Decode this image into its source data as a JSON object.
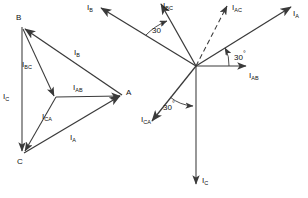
{
  "figure": {
    "stroke_color": "#3a3a3a",
    "dash_color": "#3a3a3a",
    "text_color": "#111111",
    "background": "#ffffff",
    "width": 308,
    "height": 198
  },
  "left_diagram": {
    "name": "delta-phasor-triangle",
    "vertex_labels": [
      {
        "id": "A",
        "text": "A",
        "x": 126,
        "y": 89
      },
      {
        "id": "B",
        "text": "B",
        "x": 16,
        "y": 14
      },
      {
        "id": "C",
        "text": "C",
        "x": 17,
        "y": 158
      }
    ],
    "phasor_labels": [
      {
        "id": "IB",
        "base": "I",
        "sub": "B",
        "x": 74,
        "y": 49
      },
      {
        "id": "IBC",
        "base": "I",
        "sub": "BC",
        "x": 22,
        "y": 61
      },
      {
        "id": "IC",
        "base": "I",
        "sub": "C",
        "x": 3,
        "y": 93
      },
      {
        "id": "IAB",
        "base": "I",
        "sub": "AB",
        "x": 73,
        "y": 84
      },
      {
        "id": "ICA",
        "base": "I",
        "sub": "CA",
        "x": 42,
        "y": 113
      },
      {
        "id": "IA",
        "base": "I",
        "sub": "A",
        "x": 70,
        "y": 134
      }
    ]
  },
  "right_diagram": {
    "name": "star-phasor-diagram",
    "center": {
      "x": 196,
      "y": 66
    },
    "phasor_labels": [
      {
        "id": "IB",
        "base": "I",
        "sub": "B",
        "x": 87,
        "y": 4
      },
      {
        "id": "IBC",
        "base": "I",
        "sub": "BC",
        "x": 163,
        "y": 2
      },
      {
        "id": "IAC",
        "base": "I",
        "sub": "AC",
        "x": 232,
        "y": 4
      },
      {
        "id": "IA",
        "base": "I",
        "sub": "A",
        "x": 293,
        "y": 10
      },
      {
        "id": "IAB",
        "base": "I",
        "sub": "AB",
        "x": 249,
        "y": 72
      },
      {
        "id": "ICA",
        "base": "I",
        "sub": "CA",
        "x": 141,
        "y": 116
      },
      {
        "id": "IC",
        "base": "I",
        "sub": "C",
        "x": 202,
        "y": 177
      }
    ],
    "angle_labels": [
      {
        "id": "angle-b-bc",
        "text": "30",
        "degree": "°",
        "x": 152,
        "y": 23
      },
      {
        "id": "angle-a-ab",
        "text": "30",
        "degree": "°",
        "x": 234,
        "y": 50
      },
      {
        "id": "angle-ca-c",
        "text": "30",
        "degree": "°",
        "x": 163,
        "y": 100
      }
    ]
  }
}
